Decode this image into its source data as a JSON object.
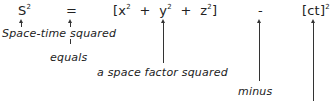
{
  "equation": {
    "s": "S",
    "s_exp": "2",
    "equals": "=",
    "bracket_open": "[",
    "x": "x",
    "x_exp": "2",
    "plus1": "+",
    "y": "y",
    "y_exp": "2",
    "plus2": "+",
    "z": "z",
    "z_exp": "2",
    "bracket_close": "]",
    "minus": "-",
    "ct": "[ct]",
    "ct_exp": "2"
  },
  "labels": {
    "spacetime": "Space-time squared",
    "equals": "equals",
    "space_factor": "a space factor squared",
    "minus": "minus"
  }
}
